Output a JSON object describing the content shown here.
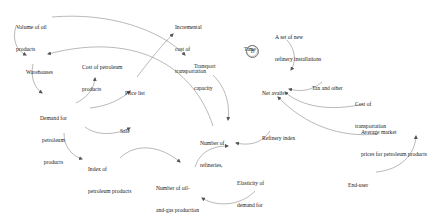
{
  "diagram": {
    "type": "causal-loop-diagram",
    "nodes": [
      {
        "id": "volume_oil_products",
        "lines": [
          "Volume of oil",
          "products"
        ]
      },
      {
        "id": "warehouses",
        "lines": [
          "Warehouses"
        ]
      },
      {
        "id": "cost_petroleum_products",
        "lines": [
          "Cost of petroleum",
          "products"
        ]
      },
      {
        "id": "price_list",
        "lines": [
          "Price list"
        ]
      },
      {
        "id": "incremental_cost_transportation",
        "lines": [
          "Incremental",
          "cost of",
          "transportation"
        ]
      },
      {
        "id": "transport_capacity",
        "lines": [
          "Transport",
          "capacity"
        ]
      },
      {
        "id": "time",
        "lines": [
          "Time"
        ]
      },
      {
        "id": "new_refinery_installations",
        "lines": [
          "A set of new",
          "refinery installations"
        ]
      },
      {
        "id": "net_avails",
        "lines": [
          "Net avails"
        ]
      },
      {
        "id": "tax_and_other",
        "lines": [
          "Tax and other"
        ]
      },
      {
        "id": "cost_of_transportation",
        "lines": [
          "Cost of",
          "transportation"
        ]
      },
      {
        "id": "demand_petroleum_products",
        "lines": [
          "Demand for",
          "petroleum",
          "products"
        ]
      },
      {
        "id": "sale",
        "lines": [
          "Sale"
        ]
      },
      {
        "id": "number_of_refineries",
        "lines": [
          "Number of",
          "refineries,"
        ]
      },
      {
        "id": "refinery_index",
        "lines": [
          "Refinery index"
        ]
      },
      {
        "id": "average_market_prices",
        "lines": [
          "Average market",
          "prices for petroleum products"
        ]
      },
      {
        "id": "index_petroleum_products",
        "lines": [
          "Index of",
          "petroleum products"
        ]
      },
      {
        "id": "number_oil_gas_equipment",
        "lines": [
          "Number of oil-",
          "and-gas production",
          "equipment"
        ]
      },
      {
        "id": "elasticity_demand",
        "lines": [
          "Elasticity of",
          "demand for",
          "petroleum products"
        ]
      },
      {
        "id": "end_user",
        "lines": [
          "End-user"
        ]
      }
    ],
    "time_loop_label": "B",
    "edges": [
      {
        "from": "volume_oil_products",
        "to": "warehouses"
      },
      {
        "from": "volume_oil_products",
        "to": "transport_capacity"
      },
      {
        "from": "number_of_refineries",
        "to": "warehouses"
      },
      {
        "from": "warehouses",
        "to": "demand_petroleum_products"
      },
      {
        "from": "demand_petroleum_products",
        "to": "cost_petroleum_products"
      },
      {
        "from": "demand_petroleum_products",
        "to": "price_list"
      },
      {
        "from": "demand_petroleum_products",
        "to": "sale"
      },
      {
        "from": "demand_petroleum_products",
        "to": "index_petroleum_products"
      },
      {
        "from": "price_list",
        "to": "incremental_cost_transportation"
      },
      {
        "from": "transport_capacity",
        "to": "number_of_refineries"
      },
      {
        "from": "index_petroleum_products",
        "to": "number_oil_gas_equipment"
      },
      {
        "from": "number_oil_gas_equipment",
        "to": "number_of_refineries"
      },
      {
        "from": "refinery_index",
        "to": "number_of_refineries"
      },
      {
        "from": "elasticity_demand",
        "to": "number_oil_gas_equipment"
      },
      {
        "from": "new_refinery_installations",
        "to": "net_avails"
      },
      {
        "from": "tax_and_other",
        "to": "net_avails"
      },
      {
        "from": "cost_of_transportation",
        "to": "net_avails"
      },
      {
        "from": "average_market_prices",
        "to": "net_avails"
      },
      {
        "from": "end_user",
        "to": "average_market_prices"
      }
    ]
  }
}
